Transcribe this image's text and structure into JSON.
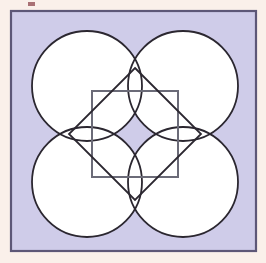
{
  "figure": {
    "canvas": {
      "width": 266,
      "height": 263,
      "background_color": "#faf0ea"
    },
    "outer_square": {
      "name": "lavender-panel",
      "x": 11,
      "y": 11,
      "width": 245,
      "height": 240,
      "fill_color": "#cfcce9",
      "stroke_color": "#5d5777",
      "stroke_width": 2.2
    },
    "circles": {
      "count": 4,
      "radius": 55,
      "fill_color": "#ffffff",
      "stroke_color": "#2b2730",
      "stroke_width": 1.8,
      "centers": [
        {
          "label": "top-left-circle",
          "cx": 87,
          "cy": 86
        },
        {
          "label": "top-right-circle",
          "cx": 183,
          "cy": 86
        },
        {
          "label": "bottom-left-circle",
          "cx": 87,
          "cy": 182
        },
        {
          "label": "bottom-right-circle",
          "cx": 183,
          "cy": 182
        }
      ]
    },
    "inner_square": {
      "name": "inner-gray-square",
      "x": 92,
      "y": 91,
      "width": 86,
      "height": 86,
      "fill_color": "none",
      "stroke_color": "#6b6b78",
      "stroke_width": 2.0
    },
    "diamond": {
      "name": "rotated-diamond",
      "center_x": 135,
      "center_y": 134,
      "half_diagonal": 66,
      "rotation_degrees": 45,
      "fill_color": "none",
      "stroke_color": "#2b2730",
      "stroke_width": 1.8,
      "vertices": [
        {
          "label": "top",
          "x": 135,
          "y": 68
        },
        {
          "label": "right",
          "x": 201,
          "y": 134
        },
        {
          "label": "bottom",
          "x": 135,
          "y": 200
        },
        {
          "label": "left",
          "x": 69,
          "y": 134
        }
      ]
    },
    "center_point": {
      "name": "rosette-center",
      "x": 135,
      "y": 134
    },
    "scan_artifact": {
      "name": "scan-speck",
      "x": 28,
      "y": 2,
      "width": 7,
      "height": 4,
      "color": "#9a5a60"
    },
    "palette": {
      "cream": "#faf0ea",
      "lavender": "#cfcce9",
      "white": "#ffffff",
      "dark_outline": "#2b2730",
      "panel_border": "#5d5777",
      "gray_outline": "#6b6b78"
    }
  }
}
